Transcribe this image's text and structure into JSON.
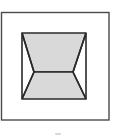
{
  "diagram": {
    "type": "geometric-figure",
    "colors": {
      "background": "#ffffff",
      "stroke": "#2a2a2a",
      "outer_stroke": "#4a4a4a",
      "fill": "#d9d9d9"
    },
    "outer_frame": {
      "x": 1,
      "y": 12,
      "width": 108,
      "height": 108
    },
    "inner_square": {
      "x": 22,
      "y": 33,
      "width": 64,
      "height": 66
    },
    "vertices": {
      "top_left": [
        22,
        33
      ],
      "top_right": [
        86,
        33
      ],
      "mid_left": [
        34,
        72
      ],
      "mid_right": [
        73,
        72
      ],
      "bottom_left": [
        22,
        99
      ],
      "bottom_right": [
        86,
        99
      ]
    },
    "caption": ""
  }
}
